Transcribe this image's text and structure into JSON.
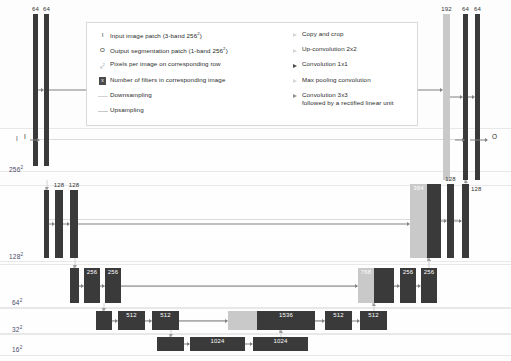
{
  "diagram": {
    "colors": {
      "bar_dark": "#3a3a3a",
      "bar_light": "#c9c9c9",
      "band_border": "#e8e8e8",
      "rail": "#dcdcdc",
      "arrow": "#808080"
    }
  },
  "axis": {
    "labels": [
      {
        "text": "I",
        "sup": "",
        "x": 16,
        "y": 135
      },
      {
        "text": "256",
        "sup": "2",
        "x": 9,
        "y": 165
      },
      {
        "text": "128",
        "sup": "2",
        "x": 9,
        "y": 252
      },
      {
        "text": "64",
        "sup": "2",
        "x": 12,
        "y": 298
      },
      {
        "text": "32",
        "sup": "2",
        "x": 12,
        "y": 325
      },
      {
        "text": "16",
        "sup": "2",
        "x": 12,
        "y": 345
      }
    ]
  },
  "io": {
    "input_letter": "I",
    "output_letter": "O"
  },
  "legend": {
    "left_items": [
      {
        "marker": "I",
        "marker_type": "letter",
        "text": "Input image patch (3-band 256²)"
      },
      {
        "marker": "O",
        "marker_type": "letter",
        "text": "Output segmentation patch (1-band 256²)"
      },
      {
        "marker": "x²",
        "marker_type": "sup",
        "text": "Pixels per image on corresponding row"
      },
      {
        "marker": "x",
        "marker_type": "box",
        "text": "Number of filters in corresponding image"
      },
      {
        "marker": "",
        "marker_type": "line-down",
        "text": "Downsampling"
      },
      {
        "marker": "",
        "marker_type": "line-up",
        "text": "Upsampling"
      }
    ],
    "right_items": [
      {
        "marker_type": "arrow-pale",
        "text": "Copy and crop"
      },
      {
        "marker_type": "arrow-pale",
        "text": "Up-convolution 2x2"
      },
      {
        "marker_type": "arrow-dark",
        "text": "Convolution 1x1"
      },
      {
        "marker_type": "arrow-pale",
        "text": "Max pooling convolution"
      },
      {
        "marker_type": "arrow-mid",
        "text": "Convolution 3x3\nfollowed by a rectified linear unit"
      }
    ]
  },
  "rows": [
    {
      "id": "row-256",
      "resolution": "256²",
      "band": {
        "top": 128,
        "height": 42
      },
      "bars": [
        {
          "name": "enc-conv1-a",
          "label": "64",
          "label_pos": "top",
          "x": 33,
          "y": 14,
          "w": 5,
          "h": 152,
          "shade": "dark"
        },
        {
          "name": "enc-conv1-b",
          "label": "64",
          "label_pos": "top",
          "x": 44,
          "y": 14,
          "w": 5,
          "h": 152,
          "shade": "dark"
        },
        {
          "name": "dec-concat-192",
          "label": "192",
          "label_pos": "top",
          "x": 443,
          "y": 14,
          "w": 7,
          "h": 166,
          "shade": "light"
        },
        {
          "name": "dec-conv1-a",
          "label": "64",
          "label_pos": "top",
          "x": 463,
          "y": 14,
          "w": 5,
          "h": 166,
          "shade": "dark"
        },
        {
          "name": "dec-conv1-b",
          "label": "64",
          "label_pos": "top",
          "x": 475,
          "y": 14,
          "w": 5,
          "h": 166,
          "shade": "dark"
        }
      ]
    },
    {
      "id": "row-128",
      "resolution": "128²",
      "band": {
        "top": 185,
        "height": 75
      },
      "bars": [
        {
          "name": "enc-pool1",
          "label": "",
          "label_pos": "top",
          "x": 44,
          "y": 190,
          "w": 5,
          "h": 68,
          "shade": "dark"
        },
        {
          "name": "enc-conv2-a",
          "label": "128",
          "label_pos": "top",
          "x": 55,
          "y": 190,
          "w": 8,
          "h": 68,
          "shade": "dark"
        },
        {
          "name": "enc-conv2-b",
          "label": "128",
          "label_pos": "top",
          "x": 70,
          "y": 190,
          "w": 8,
          "h": 68,
          "shade": "dark"
        },
        {
          "name": "dec-concat-384",
          "label": "384",
          "label_pos": "in",
          "x": 410,
          "y": 184,
          "w": 17,
          "h": 74,
          "shade": "light"
        },
        {
          "name": "dec-conv2-pre",
          "label": "",
          "label_pos": "top",
          "x": 427,
          "y": 184,
          "w": 14,
          "h": 74,
          "shade": "dark"
        },
        {
          "name": "dec-conv2-a",
          "label": "128",
          "label_pos": "top",
          "x": 447,
          "y": 184,
          "w": 7,
          "h": 74,
          "shade": "dark"
        },
        {
          "name": "dec-conv2-b",
          "label": "128",
          "label_pos": "right",
          "x": 462,
          "y": 184,
          "w": 7,
          "h": 74,
          "shade": "dark"
        }
      ]
    },
    {
      "id": "row-64",
      "resolution": "64²",
      "band": {
        "top": 264,
        "height": 42
      },
      "bars": [
        {
          "name": "enc-pool2",
          "label": "",
          "label_pos": "top",
          "x": 70,
          "y": 268,
          "w": 9,
          "h": 35,
          "shade": "dark"
        },
        {
          "name": "enc-conv3-a",
          "label": "256",
          "label_pos": "in",
          "x": 84,
          "y": 268,
          "w": 16,
          "h": 35,
          "shade": "dark"
        },
        {
          "name": "enc-conv3-b",
          "label": "256",
          "label_pos": "in",
          "x": 105,
          "y": 268,
          "w": 16,
          "h": 35,
          "shade": "dark"
        },
        {
          "name": "dec-concat-768",
          "label": "768",
          "label_pos": "in",
          "x": 358,
          "y": 268,
          "w": 16,
          "h": 35,
          "shade": "light"
        },
        {
          "name": "dec-conv3-pre",
          "label": "",
          "label_pos": "top",
          "x": 374,
          "y": 268,
          "w": 20,
          "h": 35,
          "shade": "dark"
        },
        {
          "name": "dec-conv3-a",
          "label": "256",
          "label_pos": "in",
          "x": 400,
          "y": 268,
          "w": 16,
          "h": 35,
          "shade": "dark"
        },
        {
          "name": "dec-conv3-b",
          "label": "256",
          "label_pos": "in",
          "x": 421,
          "y": 268,
          "w": 16,
          "h": 35,
          "shade": "dark"
        }
      ]
    },
    {
      "id": "row-32",
      "resolution": "32²",
      "band": {
        "top": 308,
        "height": 24
      },
      "bars": [
        {
          "name": "enc-pool3",
          "label": "",
          "label_pos": "top",
          "x": 96,
          "y": 311,
          "w": 16,
          "h": 19,
          "shade": "dark"
        },
        {
          "name": "enc-conv4-a",
          "label": "512",
          "label_pos": "in",
          "x": 118,
          "y": 311,
          "w": 27,
          "h": 19,
          "shade": "dark"
        },
        {
          "name": "enc-conv4-b",
          "label": "512",
          "label_pos": "in",
          "x": 152,
          "y": 311,
          "w": 27,
          "h": 19,
          "shade": "dark"
        },
        {
          "name": "dec-concat-1536",
          "label": "",
          "label_pos": "top",
          "x": 228,
          "y": 311,
          "w": 29,
          "h": 19,
          "shade": "light"
        },
        {
          "name": "dec-conv4-1536",
          "label": "1536",
          "label_pos": "in",
          "x": 257,
          "y": 311,
          "w": 58,
          "h": 19,
          "shade": "dark"
        },
        {
          "name": "dec-conv4-a",
          "label": "512",
          "label_pos": "in",
          "x": 325,
          "y": 311,
          "w": 27,
          "h": 19,
          "shade": "dark"
        },
        {
          "name": "dec-conv4-b",
          "label": "512",
          "label_pos": "in",
          "x": 360,
          "y": 311,
          "w": 27,
          "h": 19,
          "shade": "dark"
        }
      ]
    },
    {
      "id": "row-16",
      "resolution": "16²",
      "band": {
        "top": 334,
        "height": 20
      },
      "bars": [
        {
          "name": "enc-pool4",
          "label": "",
          "label_pos": "top",
          "x": 157,
          "y": 337,
          "w": 27,
          "h": 14,
          "shade": "dark"
        },
        {
          "name": "bottleneck-conv-a",
          "label": "1024",
          "label_pos": "in",
          "x": 190,
          "y": 337,
          "w": 55,
          "h": 14,
          "shade": "dark"
        },
        {
          "name": "bottleneck-conv-b",
          "label": "1024",
          "label_pos": "in",
          "x": 253,
          "y": 337,
          "w": 55,
          "h": 14,
          "shade": "dark"
        }
      ]
    }
  ],
  "rails": [
    {
      "name": "skip-rail-256",
      "x": 38,
      "y": 139,
      "w": 430,
      "thick": false
    },
    {
      "name": "skip-rail-128",
      "x": 48,
      "y": 219,
      "w": 410,
      "thick": false
    },
    {
      "name": "skip-rail-64",
      "x": 75,
      "y": 286,
      "w": 330,
      "thick": false
    },
    {
      "name": "skip-rail-32",
      "x": 108,
      "y": 320,
      "w": 230,
      "thick": false
    }
  ]
}
